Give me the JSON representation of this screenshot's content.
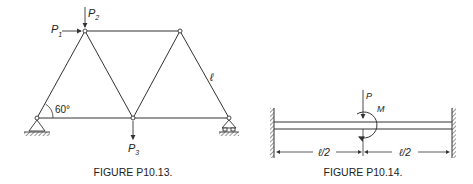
{
  "figure_13": {
    "caption": "FIGURE P10.13.",
    "loads": {
      "p1": {
        "letter": "P",
        "sub": "1"
      },
      "p2": {
        "letter": "P",
        "sub": "2"
      },
      "p3": {
        "letter": "P",
        "sub": "3"
      }
    },
    "angle_label": "60°",
    "member_length_label": "ℓ"
  },
  "figure_14": {
    "caption": "FIGURE P10.14.",
    "force_label": "P",
    "moment_label": "M",
    "left_span_label": "ℓ/2",
    "right_span_label": "ℓ/2"
  },
  "colors": {
    "line": "#333333",
    "background": "#ffffff"
  }
}
